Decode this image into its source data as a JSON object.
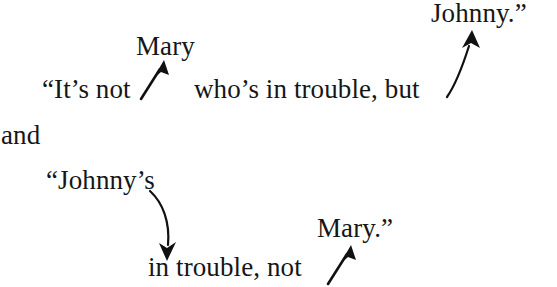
{
  "figure": {
    "type": "linguistic-reference-diagram",
    "background_color": "#ffffff",
    "text_color": "#161616",
    "width": 557,
    "height": 287
  },
  "sentences": [
    {
      "id": "sentence-1",
      "full_text": "“It’s not Mary who’s in trouble, but Johnny.”",
      "segments": {
        "opening": "“It’s not",
        "middle": "who’s in trouble, but",
        "referent_upper_left": "Mary",
        "referent_upper_right": "Johnny.”"
      }
    },
    {
      "id": "conjunction",
      "full_text": "and"
    },
    {
      "id": "sentence-2",
      "full_text": "“Johnny’s in trouble, not Mary.”",
      "segments": {
        "opening": "“Johnny’s",
        "continuation": "in trouble, not",
        "referent_lower_right": "Mary.”"
      }
    }
  ],
  "lines": {
    "mary_upper": "Mary",
    "johnny_upper": "Johnny.”",
    "line1_start": "“It’s not",
    "line1_middle": "who’s in trouble, but",
    "and": "and",
    "johnnys_start": "“Johnny’s",
    "mary_quote_lower": "Mary.”",
    "line2_continuation": "in trouble, not"
  },
  "arrows": [
    {
      "name": "arrow-not-to-mary",
      "style": "straight",
      "direction": "up-right",
      "from_label": "“It’s not",
      "to_label": "Mary",
      "color": "#111111"
    },
    {
      "name": "arrow-but-to-johnny",
      "style": "curved",
      "direction": "up-right",
      "from_label": "but",
      "to_label": "Johnny.”",
      "color": "#111111"
    },
    {
      "name": "arrow-johnnys-to-in-trouble",
      "style": "curved",
      "direction": "down",
      "from_label": "“Johnny’s",
      "to_label": "in trouble",
      "color": "#111111"
    },
    {
      "name": "arrow-not-to-mary-lower",
      "style": "straight",
      "direction": "up-right",
      "from_label": "not",
      "to_label": "Mary.”",
      "color": "#111111"
    }
  ]
}
